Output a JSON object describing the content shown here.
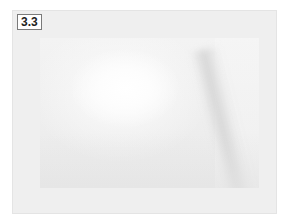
{
  "figure": {
    "label": "3.3",
    "frame_color": "#efefef",
    "label_border_color": "#7a7a7a"
  },
  "photo": {
    "description": "washed-out grayscale photograph with bright highlight on left and diagonal soft shadow on right",
    "highlight_color": "#ffffff",
    "shadow_color": "#d2d2d2"
  }
}
